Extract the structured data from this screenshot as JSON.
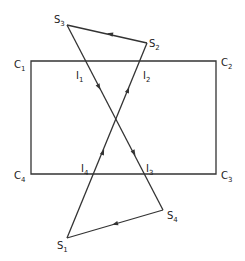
{
  "diagram": {
    "rectangle": {
      "corners": [
        {
          "id": "C1",
          "base": "C",
          "sub": "1",
          "x": 31,
          "y": 61,
          "lx": 14,
          "ly": 68
        },
        {
          "id": "C2",
          "base": "C",
          "sub": "2",
          "x": 216,
          "y": 61,
          "lx": 221,
          "ly": 66
        },
        {
          "id": "C3",
          "base": "C",
          "sub": "3",
          "x": 216,
          "y": 174,
          "lx": 221,
          "ly": 179
        },
        {
          "id": "C4",
          "base": "C",
          "sub": "4",
          "x": 31,
          "y": 174,
          "lx": 14,
          "ly": 179
        }
      ]
    },
    "polygon_vertices": [
      {
        "id": "S1",
        "base": "S",
        "sub": "1",
        "x": 67,
        "y": 238,
        "lx": 57,
        "ly": 249
      },
      {
        "id": "S2",
        "base": "S",
        "sub": "2",
        "x": 147,
        "y": 43,
        "lx": 149,
        "ly": 47
      },
      {
        "id": "S3",
        "base": "S",
        "sub": "3",
        "x": 67,
        "y": 25,
        "lx": 54,
        "ly": 23
      },
      {
        "id": "S4",
        "base": "S",
        "sub": "4",
        "x": 163,
        "y": 210,
        "lx": 167,
        "ly": 219
      }
    ],
    "intersections": [
      {
        "id": "I1",
        "base": "I",
        "sub": "1",
        "lx": 76,
        "ly": 79
      },
      {
        "id": "I2",
        "base": "I",
        "sub": "2",
        "lx": 143,
        "ly": 79
      },
      {
        "id": "I3",
        "base": "I",
        "sub": "3",
        "lx": 146,
        "ly": 172
      },
      {
        "id": "I4",
        "base": "I",
        "sub": "4",
        "lx": 81,
        "ly": 172
      }
    ],
    "edges": [
      {
        "from": "S1",
        "to": "S2"
      },
      {
        "from": "S2",
        "to": "S3"
      },
      {
        "from": "S3",
        "to": "S4"
      },
      {
        "from": "S4",
        "to": "S1"
      }
    ],
    "arrows": [
      {
        "x": 99,
        "y": 87,
        "angle": 62
      },
      {
        "x": 134,
        "y": 153,
        "angle": 62
      },
      {
        "x": 128,
        "y": 90,
        "angle": -68
      },
      {
        "x": 103,
        "y": 152,
        "angle": -68
      },
      {
        "x": 110,
        "y": 34,
        "angle": 193
      },
      {
        "x": 115,
        "y": 224,
        "angle": 164
      }
    ],
    "stroke_color": "#333333",
    "text_color": "#222222"
  }
}
